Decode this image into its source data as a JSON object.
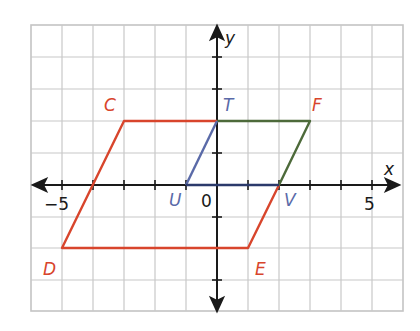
{
  "figure": {
    "type": "coordinate-plane-diagram",
    "axes": {
      "x_label": "x",
      "y_label": "y",
      "origin_label": "0",
      "x_tick_labels": [
        {
          "value": -5,
          "label": "−5"
        },
        {
          "value": 5,
          "label": "5"
        }
      ],
      "x_range": [
        -6,
        6
      ],
      "y_range": [
        -4,
        5
      ],
      "grid": true
    },
    "points": [
      {
        "name": "C",
        "x": -3,
        "y": 2,
        "color": "#d8452c"
      },
      {
        "name": "T",
        "x": 0,
        "y": 2,
        "color": "#5a6aa8"
      },
      {
        "name": "F",
        "x": 3,
        "y": 2,
        "color": "#d8452c"
      },
      {
        "name": "U",
        "x": -1,
        "y": 0,
        "color": "#5a6aa8"
      },
      {
        "name": "V",
        "x": 2,
        "y": 0,
        "color": "#5a6aa8"
      },
      {
        "name": "D",
        "x": -5,
        "y": -2,
        "color": "#d8452c"
      },
      {
        "name": "E",
        "x": 1,
        "y": -2,
        "color": "#d8452c"
      }
    ],
    "shapes": [
      {
        "name": "parallelogram-CFED",
        "color": "#d8452c",
        "vertices": [
          "C",
          "F",
          "E",
          "D"
        ]
      },
      {
        "name": "parallelogram-TFVU",
        "color": "#4d6a3a",
        "vertices": [
          "T",
          "F",
          "V",
          "U"
        ]
      },
      {
        "name": "triangle-TUV",
        "color": "#5a6aa8",
        "vertices": [
          "T",
          "U",
          "V"
        ]
      }
    ],
    "colors": {
      "grid": "#c8c8c8",
      "axis": "#1a1a1a",
      "red": "#d8452c",
      "green": "#4d6a3a",
      "blue": "#5a6aa8",
      "navy": "#2b3a6b"
    }
  },
  "labels": {
    "C": "C",
    "T": "T",
    "F": "F",
    "U": "U",
    "V": "V",
    "D": "D",
    "E": "E",
    "x_axis": "x",
    "y_axis": "y",
    "origin": "0",
    "neg5": "−5",
    "pos5": "5"
  }
}
